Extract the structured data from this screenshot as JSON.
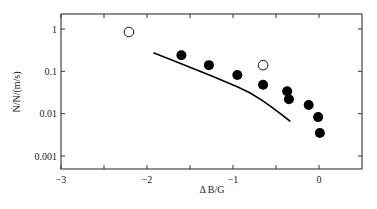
{
  "chart_data": {
    "type": "scatter",
    "title": "",
    "xlabel": "Δ B/G",
    "ylabel": "Ṅ/N/(m/s)",
    "xlim": [
      -3,
      0.5
    ],
    "ylim": [
      0.0006,
      2
    ],
    "yscale": "log",
    "grid": false,
    "legend": null,
    "x_ticks": [
      {
        "value": -3,
        "label": "−3"
      },
      {
        "value": -2,
        "label": "−2"
      },
      {
        "value": -1,
        "label": "−1"
      },
      {
        "value": 0,
        "label": "0"
      }
    ],
    "x_minor_ticks": [
      -2.5,
      -1.5,
      -0.5
    ],
    "y_ticks": [
      {
        "value": 1,
        "label": "1"
      },
      {
        "value": 0.1,
        "label": "0.1"
      },
      {
        "value": 0.01,
        "label": "0.01"
      },
      {
        "value": 0.001,
        "label": "0.001"
      }
    ],
    "series": [
      {
        "name": "filled circles",
        "marker": "filled-circle",
        "color": "#000000",
        "points": [
          {
            "x": -1.6,
            "y": 0.24
          },
          {
            "x": -1.28,
            "y": 0.14
          },
          {
            "x": -0.95,
            "y": 0.082
          },
          {
            "x": -0.65,
            "y": 0.048
          },
          {
            "x": -0.37,
            "y": 0.034
          },
          {
            "x": -0.35,
            "y": 0.022
          },
          {
            "x": -0.12,
            "y": 0.016
          },
          {
            "x": -0.01,
            "y": 0.0083
          },
          {
            "x": 0.01,
            "y": 0.0035
          }
        ]
      },
      {
        "name": "open circles",
        "marker": "open-circle",
        "color": "#000000",
        "points": [
          {
            "x": -2.21,
            "y": 0.85
          },
          {
            "x": -0.65,
            "y": 0.14
          }
        ]
      },
      {
        "name": "theory curve",
        "marker": "line",
        "color": "#000000",
        "points": [
          {
            "x": -1.92,
            "y": 0.27
          },
          {
            "x": -1.65,
            "y": 0.165
          },
          {
            "x": -1.38,
            "y": 0.1
          },
          {
            "x": -1.1,
            "y": 0.058
          },
          {
            "x": -0.8,
            "y": 0.032
          },
          {
            "x": -0.55,
            "y": 0.0145
          },
          {
            "x": -0.34,
            "y": 0.0067
          }
        ]
      }
    ]
  }
}
